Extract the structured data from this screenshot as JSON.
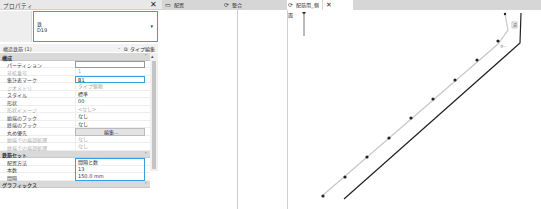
{
  "properties": {
    "title": "プロパティ",
    "close_label": "✕",
    "type_selector": {
      "line1": "鉄",
      "line2": "D19",
      "arrow": "▾"
    },
    "filter": {
      "label": "構造鉄筋 (1)",
      "edit_type_label": "タイプ編集",
      "edit_type_icon": "⧉"
    },
    "sections": [
      {
        "label": "構成",
        "rows": [
          {
            "name": "パーティション",
            "value": "",
            "kind": "input"
          },
          {
            "name": "非拡番号",
            "value": "1",
            "kind": "disabled"
          },
          {
            "name": "集計表マーク",
            "value": "B1",
            "kind": "active"
          },
          {
            "name": "ジオメトリ",
            "value": "タイプ駆動",
            "kind": "disabled"
          },
          {
            "name": "スタイル",
            "value": "標準",
            "kind": "text"
          },
          {
            "name": "形状",
            "value": "00",
            "kind": "text"
          },
          {
            "name": "形状イメージ",
            "value": "<なし>",
            "kind": "disabled"
          },
          {
            "name": "始端のフック",
            "value": "なし",
            "kind": "text"
          },
          {
            "name": "終端のフック",
            "value": "なし",
            "kind": "text"
          },
          {
            "name": "丸め優先",
            "value": "編集...",
            "kind": "button"
          },
          {
            "name": "始端での端部処理",
            "value": "なし",
            "kind": "disabled"
          },
          {
            "name": "終端での端部処理",
            "value": "なし",
            "kind": "disabled"
          }
        ]
      },
      {
        "label": "鉄筋セット",
        "rows": [
          {
            "name": "配置方法",
            "value": "間隔と数",
            "kind": "group"
          },
          {
            "name": "本数",
            "value": "13",
            "kind": "group"
          },
          {
            "name": "間隔",
            "value": "150.0 mm",
            "kind": "group"
          }
        ]
      },
      {
        "label": "グラフィックス",
        "rows": []
      }
    ],
    "section_toggle": "˄"
  },
  "tabs": [
    {
      "label": "配置",
      "icon": "▭",
      "active": false
    },
    {
      "label": "整合",
      "icon": "⟳",
      "active": false
    },
    {
      "label": "配筋用_側面",
      "icon": "⟳",
      "active": true,
      "close": "✕"
    }
  ],
  "view": {
    "annotations": [
      "鉄",
      "ター"
    ]
  }
}
